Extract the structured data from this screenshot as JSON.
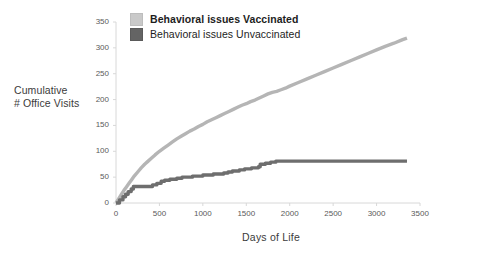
{
  "chart_data": {
    "type": "line",
    "title": "",
    "xlabel": "Days of Life",
    "ylabel": "Cumulative\n# Office Visits",
    "ylabel_line1": "Cumulative",
    "ylabel_line2": "# Office Visits",
    "xlim": [
      0,
      3500
    ],
    "ylim": [
      0,
      350
    ],
    "xticks": [
      0,
      500,
      1000,
      1500,
      2000,
      2500,
      3000,
      3500
    ],
    "yticks": [
      0,
      50,
      100,
      150,
      200,
      250,
      300,
      350
    ],
    "grid": false,
    "legend_position": "top-center",
    "series": [
      {
        "name": "Behavioral issues Vaccinated",
        "color": "#b5b5b5",
        "bold_label": true,
        "x": [
          0,
          30,
          60,
          90,
          120,
          150,
          180,
          210,
          250,
          290,
          330,
          370,
          410,
          450,
          500,
          550,
          600,
          650,
          700,
          750,
          800,
          850,
          900,
          950,
          1000,
          1050,
          1100,
          1150,
          1200,
          1250,
          1300,
          1350,
          1400,
          1450,
          1500,
          1550,
          1600,
          1650,
          1700,
          1750,
          1800,
          1850,
          1900,
          1950,
          2000,
          2100,
          2200,
          2300,
          2400,
          2500,
          2600,
          2700,
          2800,
          2900,
          3000,
          3100,
          3200,
          3300,
          3350
        ],
        "y": [
          0,
          8,
          16,
          24,
          31,
          38,
          45,
          52,
          60,
          68,
          75,
          81,
          87,
          93,
          100,
          106,
          112,
          118,
          124,
          129,
          134,
          139,
          143,
          148,
          152,
          157,
          161,
          165,
          169,
          173,
          177,
          181,
          185,
          189,
          192,
          196,
          199,
          203,
          207,
          211,
          214,
          216,
          219,
          222,
          226,
          233,
          240,
          247,
          254,
          261,
          268,
          275,
          282,
          289,
          296,
          303,
          309,
          316,
          319
        ]
      },
      {
        "name": "Behavioral issues Unvaccinated",
        "color": "#6e6e6e",
        "bold_label": false,
        "x": [
          0,
          40,
          40,
          80,
          80,
          110,
          110,
          140,
          140,
          175,
          175,
          200,
          200,
          420,
          420,
          470,
          470,
          520,
          520,
          560,
          560,
          620,
          620,
          700,
          700,
          760,
          760,
          880,
          880,
          1000,
          1000,
          1120,
          1120,
          1240,
          1240,
          1290,
          1290,
          1340,
          1340,
          1420,
          1420,
          1480,
          1480,
          1560,
          1560,
          1640,
          1640,
          1660,
          1660,
          1720,
          1720,
          1780,
          1780,
          1840,
          1840,
          3350
        ],
        "y": [
          0,
          0,
          6,
          6,
          12,
          12,
          17,
          17,
          22,
          22,
          27,
          27,
          32,
          32,
          35,
          35,
          38,
          38,
          42,
          42,
          44,
          44,
          46,
          46,
          48,
          48,
          50,
          50,
          52,
          52,
          54,
          54,
          56,
          56,
          58,
          58,
          60,
          60,
          62,
          62,
          64,
          64,
          66,
          66,
          68,
          68,
          70,
          70,
          75,
          75,
          77,
          77,
          79,
          79,
          81,
          81
        ]
      }
    ]
  },
  "axis": {
    "ytick_labels": [
      "350",
      "300",
      "250",
      "200",
      "150",
      "100",
      "50",
      "0"
    ],
    "xtick_labels": [
      "0",
      "500",
      "1000",
      "1500",
      "2000",
      "2500",
      "3000",
      "3500"
    ]
  },
  "legend": {
    "items": [
      {
        "label": "Behavioral issues Vaccinated",
        "color": "#c9c9c9"
      },
      {
        "label": "Behavioral issues Unvaccinated",
        "color": "#646464"
      }
    ]
  }
}
